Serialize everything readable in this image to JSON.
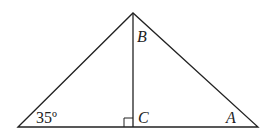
{
  "diagram": {
    "type": "triangle",
    "labels": {
      "top": "B",
      "foot": "C",
      "right": "A",
      "left_angle": "35º"
    },
    "colors": {
      "stroke": "#222222",
      "background": "#ffffff"
    }
  }
}
